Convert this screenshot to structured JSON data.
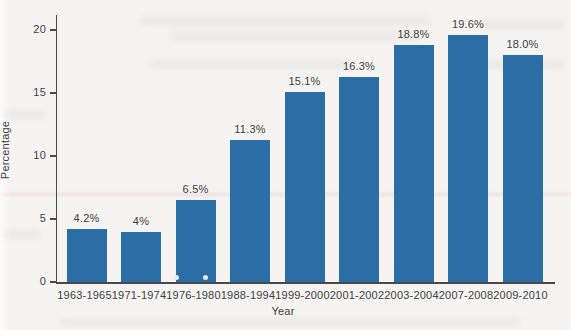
{
  "chart_data": {
    "type": "bar",
    "title": "",
    "xlabel": "Year",
    "ylabel": "Percentage",
    "categories": [
      "1963-1965",
      "1971-1974",
      "1976-1980",
      "1988-1994",
      "1999-2000",
      "2001-2002",
      "2003-2004",
      "2007-2008",
      "2009-2010"
    ],
    "values": [
      4.2,
      4,
      6.5,
      11.3,
      15.1,
      16.3,
      18.8,
      19.6,
      18.0
    ],
    "bar_labels": [
      "4.2%",
      "4%",
      "6.5%",
      "11.3%",
      "15.1%",
      "16.3%",
      "18.8%",
      "19.6%",
      "18.0%"
    ],
    "y_ticks": [
      0,
      5,
      10,
      15,
      20
    ],
    "ylim": [
      0,
      21.2
    ],
    "grid": false,
    "legend_position": "none",
    "bar_color": "#2b6da5",
    "axis_color": "#4a4a4a",
    "text_color": "#3e3e3e",
    "background_color": "#f5f4f2"
  }
}
